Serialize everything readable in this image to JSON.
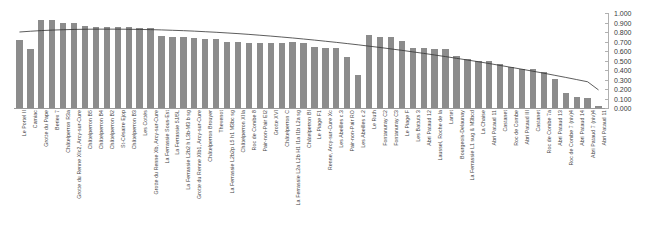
{
  "chart_data": {
    "type": "bar",
    "title": "",
    "subtitle": "",
    "xlabel": "",
    "ylabel": "",
    "ylim": [
      0.0,
      1.0
    ],
    "grid": false,
    "legend": false,
    "legend_position": "none",
    "y_axis_position": "right",
    "y_ticks": [
      "0.000",
      "0.100",
      "0.200",
      "0.300",
      "0.400",
      "0.500",
      "0.600",
      "0.700",
      "0.800",
      "0.900",
      "1.000"
    ],
    "y_tick_values": [
      0.0,
      0.1,
      0.2,
      0.3,
      0.4,
      0.5,
      0.6,
      0.7,
      0.8,
      0.9,
      1.0
    ],
    "bar_color": "#8c8c8c",
    "trend_color": "#333333",
    "axis_color": "#b0b0b0",
    "series": [
      {
        "name": "value",
        "type": "bar",
        "values": [
          0.72,
          0.62,
          0.93,
          0.93,
          0.89,
          0.89,
          0.86,
          0.85,
          0.85,
          0.85,
          0.85,
          0.84,
          0.84,
          0.76,
          0.75,
          0.75,
          0.74,
          0.73,
          0.73,
          0.7,
          0.69,
          0.68,
          0.68,
          0.68,
          0.68,
          0.69,
          0.68,
          0.64,
          0.63,
          0.63,
          0.54,
          0.35,
          0.77,
          0.75,
          0.75,
          0.71,
          0.63,
          0.63,
          0.62,
          0.62,
          0.55,
          0.52,
          0.5,
          0.49,
          0.46,
          0.43,
          0.41,
          0.41,
          0.38,
          0.31,
          0.16,
          0.12,
          0.11,
          0.02
        ]
      },
      {
        "name": "trend",
        "type": "line",
        "values": [
          0.8,
          0.808,
          0.815,
          0.82,
          0.824,
          0.827,
          0.829,
          0.83,
          0.83,
          0.83,
          0.829,
          0.827,
          0.825,
          0.822,
          0.818,
          0.814,
          0.809,
          0.803,
          0.797,
          0.79,
          0.783,
          0.775,
          0.766,
          0.757,
          0.747,
          0.737,
          0.726,
          0.715,
          0.703,
          0.691,
          0.678,
          0.665,
          0.651,
          0.637,
          0.622,
          0.607,
          0.591,
          0.575,
          0.558,
          0.541,
          0.523,
          0.505,
          0.487,
          0.468,
          0.448,
          0.428,
          0.408,
          0.387,
          0.366,
          0.344,
          0.322,
          0.299,
          0.276,
          0.19
        ]
      }
    ],
    "categories": [
      "Le Portel II",
      "Camiac",
      "Grotte du Pape",
      "Beriex 7",
      "Châtelperron R3a",
      "Grotte du Renne XIc2, Arcy-sur-Cure",
      "Châtelperron B5",
      "Châtelperron B4",
      "Châtelperron B2",
      "St-Césaire Ejop",
      "Châtelperron B3",
      "Les Cottés",
      "Grotte du Renne Xb, Arcy-sur-Cure",
      "La Ferrassie Sous-Est",
      "La Ferrassie 5J/5L",
      "La Ferrassie L2b2 h L3b-M3 b sg",
      "Grotte du Renne XIb1, Arcy-sur-Cure",
      "Châtelperron Brouyer",
      "Thevenot",
      "La Ferrassie L2b2p L5 h1 M3bc sg",
      "Châtelperron XIIa",
      "Roc de Combe 8",
      "Pair-non-Pair EI2",
      "Grotte XVI",
      "Châtelperron C",
      "La Ferrassie L2a L2b H1 I1a I1b L2a sg",
      "Châtelperron BI",
      "Le Piage F1",
      "Renne, Arcy-sur-Cure Xc",
      "Les Abeilles c.3",
      "Pair-non-Pair RO",
      "Les Abeilles c.2",
      "Le Ruth",
      "Fontanuray C2",
      "Fontanuray C3",
      "Le Piage F",
      "Les Battuts 3",
      "Abri Pataud 12",
      "Laussel, Roche de la",
      "Lartet",
      "Bourgeois-Delaunay",
      "La Ferrassie L1 sug & M3bcd",
      "La Chaise",
      "Abri Pataud 11",
      "Castanet",
      "Roc de Combe",
      "Abri Pataud III",
      "Castanet",
      "Roc de Combe 7a",
      "Abri Pataud 13",
      "Roc de Combe 7 (niv)4",
      "Abri Pataud 14",
      "Abri Pataud 7 (niv)4",
      "Abri Pataud 11"
    ]
  }
}
